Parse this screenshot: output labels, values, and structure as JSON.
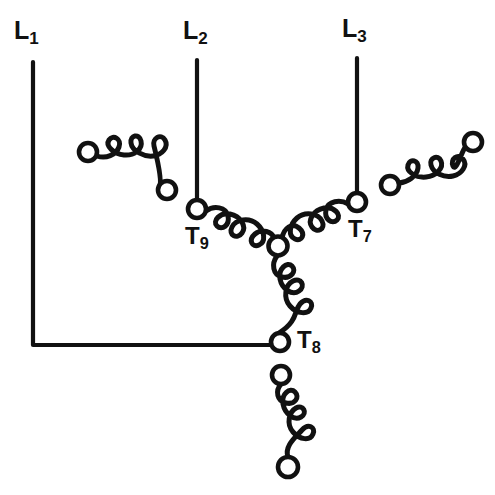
{
  "figure": {
    "kind": "electrical-schematic",
    "background_color": "#ffffff",
    "line_color": "#111111",
    "width": 495,
    "height": 495
  },
  "labels": {
    "l1": {
      "text": "L",
      "sub": "1"
    },
    "l2": {
      "text": "L",
      "sub": "2"
    },
    "l3": {
      "text": "L",
      "sub": "3"
    },
    "t7": {
      "text": "T",
      "sub": "7"
    },
    "t8": {
      "text": "T",
      "sub": "8"
    },
    "t9": {
      "text": "T",
      "sub": "9"
    }
  },
  "schematic": {
    "supply_lines": [
      {
        "name": "L1",
        "x": 33,
        "y_top": 62,
        "y_bottom": 345,
        "bend_to_x": 278
      },
      {
        "name": "L2",
        "x": 197,
        "y_top": 60,
        "y_bottom": 200
      },
      {
        "name": "L3",
        "x": 357,
        "y_top": 58,
        "y_bottom": 193
      }
    ],
    "terminals": [
      {
        "name": "T9",
        "cx": 197,
        "cy": 209,
        "r": 9
      },
      {
        "name": "T7",
        "cx": 357,
        "cy": 202,
        "r": 9
      },
      {
        "name": "T8",
        "cx": 280,
        "cy": 342,
        "r": 9
      },
      {
        "name": "wye-point",
        "cx": 278,
        "cy": 246,
        "r": 9.5
      }
    ],
    "coils": [
      {
        "name": "coil-t9-to-wye",
        "from": "T9",
        "to": "wye-point",
        "humps": 4,
        "connected": true
      },
      {
        "name": "coil-t7-to-wye",
        "from": "T7",
        "to": "wye-point",
        "humps": 4,
        "connected": true
      },
      {
        "name": "coil-wye-to-t8",
        "from": "wye-point",
        "to": "T8",
        "humps": 4,
        "connected": true
      },
      {
        "name": "coil-upper-left-free",
        "from_cx": 88,
        "from_cy": 152,
        "to_cx": 167,
        "to_cy": 190,
        "humps": 4,
        "connected": false
      },
      {
        "name": "coil-upper-right-free",
        "from_cx": 390,
        "from_cy": 185,
        "to_cx": 473,
        "to_cy": 142,
        "humps": 4,
        "connected": false
      },
      {
        "name": "coil-lower-free",
        "from_cx": 281,
        "from_cy": 375,
        "to_cx": 288,
        "to_cy": 467,
        "humps": 4,
        "connected": false
      }
    ],
    "free_nodes": [
      {
        "name": "upper-left-coil-start",
        "cx": 88,
        "cy": 152,
        "r": 9
      },
      {
        "name": "upper-left-coil-end",
        "cx": 167,
        "cy": 190,
        "r": 9
      },
      {
        "name": "upper-right-coil-start",
        "cx": 390,
        "cy": 185,
        "r": 9
      },
      {
        "name": "upper-right-coil-end",
        "cx": 473,
        "cy": 142,
        "r": 9
      },
      {
        "name": "lower-coil-top",
        "cx": 281,
        "cy": 375,
        "r": 9
      },
      {
        "name": "lower-coil-bottom",
        "cx": 288,
        "cy": 467,
        "r": 10
      }
    ]
  }
}
